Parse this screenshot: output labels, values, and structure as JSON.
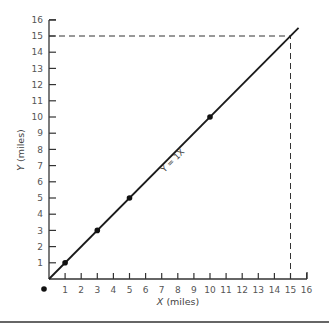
{
  "chart_data": {
    "type": "line",
    "title": "",
    "xlabel": "X (miles)",
    "ylabel": "Y (miles)",
    "xlim": [
      0,
      16
    ],
    "ylim": [
      0,
      16
    ],
    "xticks": [
      1,
      2,
      3,
      4,
      5,
      6,
      7,
      8,
      9,
      10,
      11,
      12,
      13,
      14,
      15,
      16
    ],
    "yticks": [
      1,
      2,
      3,
      4,
      5,
      6,
      7,
      8,
      9,
      10,
      11,
      12,
      13,
      14,
      15,
      16
    ],
    "grid": false,
    "series": [
      {
        "name": "Y = 1X",
        "x": [
          0,
          15.5
        ],
        "y": [
          0,
          15.5
        ],
        "markers": [
          {
            "x": 1,
            "y": 1
          },
          {
            "x": 3,
            "y": 3
          },
          {
            "x": 5,
            "y": 5
          },
          {
            "x": 10,
            "y": 10
          }
        ]
      }
    ],
    "annotations": [
      {
        "type": "line-label",
        "text": "Y = 1X",
        "x": 7.5,
        "y": 7.5
      },
      {
        "type": "dashed-guide",
        "from": [
          0,
          15
        ],
        "to": [
          15,
          15
        ]
      },
      {
        "type": "dashed-guide",
        "from": [
          15,
          0
        ],
        "to": [
          15,
          15
        ]
      },
      {
        "type": "point",
        "x": -0.3,
        "y": -0.6,
        "note": "origin dot below axis"
      }
    ],
    "x_axis_label": {
      "var": "X",
      "unit": "(miles)"
    },
    "y_axis_label": {
      "var": "Y",
      "unit": "(miles)"
    }
  }
}
